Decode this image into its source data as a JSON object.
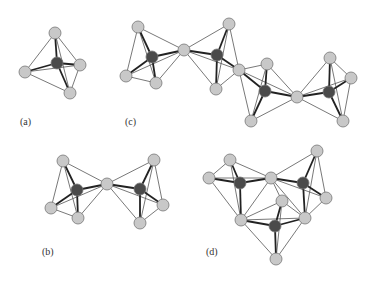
{
  "figure": {
    "panels": [
      {
        "id": "a",
        "label": "(a)",
        "label_pos": [
          20,
          126
        ]
      },
      {
        "id": "b",
        "label": "(b)",
        "label_pos": [
          42,
          256
        ]
      },
      {
        "id": "c",
        "label": "(c)",
        "label_pos": [
          125,
          126
        ]
      },
      {
        "id": "d",
        "label": "(d)",
        "label_pos": [
          206,
          256
        ]
      }
    ],
    "colors": {
      "light_atom": "#c8c8c8",
      "dark_atom": "#4a4a4a",
      "atom_stroke": "#777777",
      "thin_bond": "#555555",
      "thick_bond": "#222222"
    },
    "atom_radius": {
      "light": 6,
      "dark": 6
    }
  },
  "structures": {
    "a": {
      "atoms": [
        {
          "x": 55,
          "y": 33,
          "type": "light"
        },
        {
          "x": 57,
          "y": 63,
          "type": "dark"
        },
        {
          "x": 80,
          "y": 65,
          "type": "light"
        },
        {
          "x": 25,
          "y": 72,
          "type": "light"
        },
        {
          "x": 70,
          "y": 93,
          "type": "light"
        }
      ],
      "center": 1,
      "cage": [
        [
          0,
          2
        ],
        [
          0,
          3
        ],
        [
          3,
          4
        ],
        [
          4,
          2
        ],
        [
          0,
          4
        ],
        [
          3,
          2
        ]
      ]
    },
    "b": {
      "atoms": [
        {
          "x": 63,
          "y": 161,
          "type": "light"
        },
        {
          "x": 77,
          "y": 190,
          "type": "dark"
        },
        {
          "x": 107,
          "y": 184,
          "type": "light"
        },
        {
          "x": 51,
          "y": 208,
          "type": "light"
        },
        {
          "x": 78,
          "y": 218,
          "type": "light"
        },
        {
          "x": 154,
          "y": 160,
          "type": "light"
        },
        {
          "x": 140,
          "y": 189,
          "type": "dark"
        },
        {
          "x": 163,
          "y": 205,
          "type": "light"
        },
        {
          "x": 140,
          "y": 223,
          "type": "light"
        }
      ]
    },
    "c": {
      "atoms": [
        {
          "x": 138,
          "y": 27,
          "type": "light"
        },
        {
          "x": 152,
          "y": 57,
          "type": "dark"
        },
        {
          "x": 184,
          "y": 50,
          "type": "light"
        },
        {
          "x": 126,
          "y": 76,
          "type": "light"
        },
        {
          "x": 156,
          "y": 83,
          "type": "light"
        },
        {
          "x": 229,
          "y": 24,
          "type": "light"
        },
        {
          "x": 217,
          "y": 55,
          "type": "dark"
        },
        {
          "x": 239,
          "y": 70,
          "type": "light"
        },
        {
          "x": 216,
          "y": 89,
          "type": "light"
        },
        {
          "x": 267,
          "y": 64,
          "type": "light"
        },
        {
          "x": 265,
          "y": 91,
          "type": "dark"
        },
        {
          "x": 297,
          "y": 97,
          "type": "light"
        },
        {
          "x": 251,
          "y": 121,
          "type": "light"
        },
        {
          "x": 330,
          "y": 58,
          "type": "light"
        },
        {
          "x": 351,
          "y": 78,
          "type": "light"
        },
        {
          "x": 329,
          "y": 92,
          "type": "dark"
        },
        {
          "x": 343,
          "y": 121,
          "type": "light"
        }
      ]
    },
    "d": {
      "atoms": [
        {
          "x": 230,
          "y": 160,
          "type": "light"
        },
        {
          "x": 209,
          "y": 178,
          "type": "light"
        },
        {
          "x": 240,
          "y": 183,
          "type": "dark"
        },
        {
          "x": 271,
          "y": 178,
          "type": "light"
        },
        {
          "x": 317,
          "y": 151,
          "type": "light"
        },
        {
          "x": 303,
          "y": 183,
          "type": "dark"
        },
        {
          "x": 326,
          "y": 198,
          "type": "light"
        },
        {
          "x": 282,
          "y": 201,
          "type": "light"
        },
        {
          "x": 305,
          "y": 218,
          "type": "light"
        },
        {
          "x": 241,
          "y": 220,
          "type": "light"
        },
        {
          "x": 275,
          "y": 226,
          "type": "dark"
        },
        {
          "x": 276,
          "y": 259,
          "type": "light"
        }
      ]
    }
  }
}
